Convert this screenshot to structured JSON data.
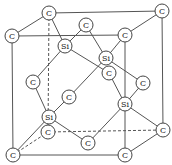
{
  "diagram": {
    "atom_radius": 7,
    "atoms": [
      {
        "id": "c_tbl",
        "label": "C",
        "x": 49,
        "y": 13
      },
      {
        "id": "c_tbr",
        "label": "C",
        "x": 162,
        "y": 11
      },
      {
        "id": "c_tfl",
        "label": "C",
        "x": 12,
        "y": 36
      },
      {
        "id": "c_tfr",
        "label": "C",
        "x": 125,
        "y": 35
      },
      {
        "id": "c_top",
        "label": "C",
        "x": 86,
        "y": 25
      },
      {
        "id": "si1",
        "label": "Si",
        "x": 65,
        "y": 46
      },
      {
        "id": "si2",
        "label": "Si",
        "x": 106,
        "y": 58
      },
      {
        "id": "c_front",
        "label": "C",
        "x": 109,
        "y": 73
      },
      {
        "id": "c_right",
        "label": "C",
        "x": 143,
        "y": 83
      },
      {
        "id": "c_left",
        "label": "C",
        "x": 33,
        "y": 82
      },
      {
        "id": "c_mid",
        "label": "C",
        "x": 69,
        "y": 97
      },
      {
        "id": "si3",
        "label": "Si",
        "x": 125,
        "y": 104
      },
      {
        "id": "si4",
        "label": "Si",
        "x": 49,
        "y": 117
      },
      {
        "id": "c_back",
        "label": "C",
        "x": 48,
        "y": 132
      },
      {
        "id": "c_bot",
        "label": "C",
        "x": 88,
        "y": 143
      },
      {
        "id": "c_bbr",
        "label": "C",
        "x": 163,
        "y": 130
      },
      {
        "id": "c_bfl",
        "label": "C",
        "x": 13,
        "y": 155
      },
      {
        "id": "c_bfr",
        "label": "C",
        "x": 125,
        "y": 155
      }
    ],
    "edges": [
      {
        "a": "c_tfl",
        "b": "c_tfr",
        "style": "solid"
      },
      {
        "a": "c_tfl",
        "b": "c_bfl",
        "style": "solid"
      },
      {
        "a": "c_bfl",
        "b": "c_bfr",
        "style": "solid"
      },
      {
        "a": "c_tfr",
        "b": "c_bfr",
        "style": "solid"
      },
      {
        "a": "c_tbl",
        "b": "c_tbr",
        "style": "solid"
      },
      {
        "a": "c_tbr",
        "b": "c_bbr",
        "style": "solid"
      },
      {
        "a": "c_tfl",
        "b": "c_tbl",
        "style": "solid"
      },
      {
        "a": "c_tfr",
        "b": "c_tbr",
        "style": "solid"
      },
      {
        "a": "c_bfr",
        "b": "c_bbr",
        "style": "solid"
      },
      {
        "a": "c_tbl",
        "b": "c_back",
        "style": "dashed"
      },
      {
        "a": "c_back",
        "b": "c_bbr",
        "style": "dashed"
      },
      {
        "a": "c_bfl",
        "b": "c_back",
        "style": "dashed"
      },
      {
        "a": "si1",
        "b": "c_tbl",
        "style": "solid"
      },
      {
        "a": "si1",
        "b": "c_top",
        "style": "solid"
      },
      {
        "a": "si1",
        "b": "c_left",
        "style": "solid"
      },
      {
        "a": "si1",
        "b": "c_front",
        "style": "solid"
      },
      {
        "a": "si2",
        "b": "c_tfr",
        "style": "solid"
      },
      {
        "a": "si2",
        "b": "c_top",
        "style": "solid"
      },
      {
        "a": "si2",
        "b": "c_mid",
        "style": "solid"
      },
      {
        "a": "si2",
        "b": "c_right",
        "style": "solid"
      },
      {
        "a": "si3",
        "b": "c_right",
        "style": "solid"
      },
      {
        "a": "si3",
        "b": "c_front",
        "style": "solid"
      },
      {
        "a": "si3",
        "b": "c_bot",
        "style": "solid"
      },
      {
        "a": "si3",
        "b": "c_bbr",
        "style": "solid"
      },
      {
        "a": "si4",
        "b": "c_left",
        "style": "solid"
      },
      {
        "a": "si4",
        "b": "c_mid",
        "style": "solid"
      },
      {
        "a": "si4",
        "b": "c_bfl",
        "style": "solid"
      },
      {
        "a": "si4",
        "b": "c_bot",
        "style": "solid"
      }
    ]
  }
}
